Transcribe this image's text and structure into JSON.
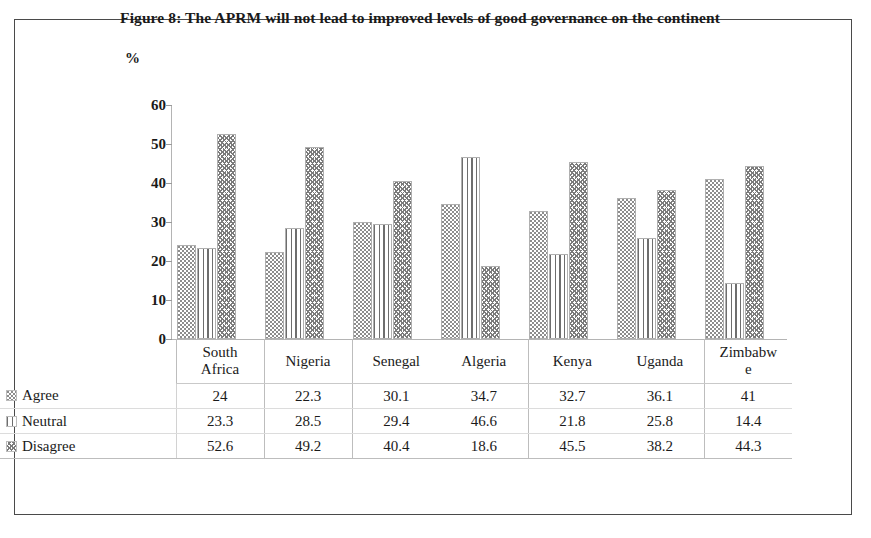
{
  "figure": {
    "title": "Figure 8: The APRM will not lead to improved levels of good governance on the continent",
    "axis_unit_label": "%"
  },
  "chart_data": {
    "type": "bar",
    "title": "Figure 8: The APRM will not lead to improved levels of good governance on the continent",
    "xlabel": "",
    "ylabel": "%",
    "ylim": [
      0,
      60
    ],
    "yticks": [
      0,
      10,
      20,
      30,
      40,
      50,
      60
    ],
    "grid": false,
    "legend_position": "table-row-headers",
    "categories": [
      "South Africa",
      "Nigeria",
      "Senegal",
      "Algeria",
      "Kenya",
      "Uganda",
      "Zimbabwe"
    ],
    "category_display": [
      [
        "South",
        "Africa"
      ],
      [
        "Nigeria",
        ""
      ],
      [
        "Senegal",
        ""
      ],
      [
        "Algeria",
        ""
      ],
      [
        "Kenya",
        ""
      ],
      [
        "Uganda",
        ""
      ],
      [
        "Zimbabw",
        "e"
      ]
    ],
    "series": [
      {
        "name": "Agree",
        "pattern": "dots",
        "values": [
          24,
          22.3,
          30.1,
          34.7,
          32.7,
          36.1,
          41
        ],
        "labels": [
          "24",
          "22.3",
          "30.1",
          "34.7",
          "32.7",
          "36.1",
          "41"
        ]
      },
      {
        "name": "Neutral",
        "pattern": "vertical-lines",
        "values": [
          23.3,
          28.5,
          29.4,
          46.6,
          21.8,
          25.8,
          14.4
        ],
        "labels": [
          "23.3",
          "28.5",
          "29.4",
          "46.6",
          "21.8",
          "25.8",
          "14.4"
        ]
      },
      {
        "name": "Disagree",
        "pattern": "wave",
        "values": [
          52.6,
          49.2,
          40.4,
          18.6,
          45.5,
          38.2,
          44.3
        ],
        "labels": [
          "52.6",
          "49.2",
          "40.4",
          "18.6",
          "45.5",
          "38.2",
          "44.3"
        ]
      }
    ]
  },
  "colors": {
    "frame": "#4a4a4a",
    "axis": "#b4b4b4",
    "text": "#1a1a1a",
    "pattern_ink": "#7b7b7b",
    "table_rule": "#c9c9c9"
  }
}
